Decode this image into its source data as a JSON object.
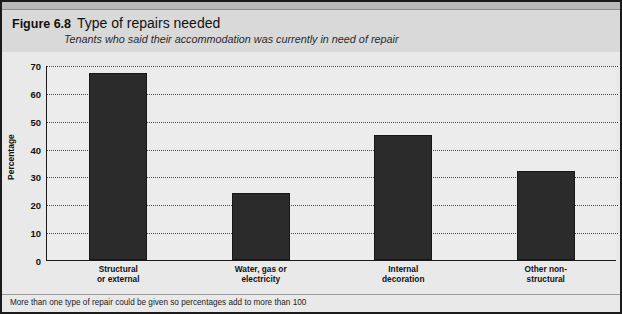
{
  "figure": {
    "number_label": "Figure 6.8",
    "title": "Type of repairs needed",
    "subtitle": "Tenants who said their accommodation was currently in need of repair",
    "footnote": "More than one type of repair could be given so percentages add to more than 100",
    "colors": {
      "bar": "#2b2b2b",
      "plot_background": "#ececed",
      "header_background": "#d9d9da",
      "frame": "#1b1b1b",
      "gridline": "#4a4a4a"
    }
  },
  "chart_data": {
    "type": "bar",
    "title": "Type of repairs needed",
    "subtitle": "Tenants who said their accommodation was currently in need of repair",
    "categories": [
      "Structural or external",
      "Water, gas or electricity",
      "Internal decoration",
      "Other non-structural"
    ],
    "category_lines": [
      [
        "Structural",
        "or external"
      ],
      [
        "Water, gas or",
        "electricity"
      ],
      [
        "Internal",
        "decoration"
      ],
      [
        "Other non-",
        "structural"
      ]
    ],
    "values": [
      67,
      24,
      45,
      32
    ],
    "xlabel": "",
    "ylabel": "Percentage",
    "ylim": [
      0,
      70
    ],
    "yticks": [
      0,
      10,
      20,
      30,
      40,
      50,
      60,
      70
    ],
    "ytick_labels": [
      "0",
      "10",
      "20",
      "30",
      "40",
      "50",
      "60",
      "70"
    ],
    "grid": true,
    "grid_axis": "y",
    "legend": false,
    "note": "More than one type of repair could be given so percentages add to more than 100"
  }
}
